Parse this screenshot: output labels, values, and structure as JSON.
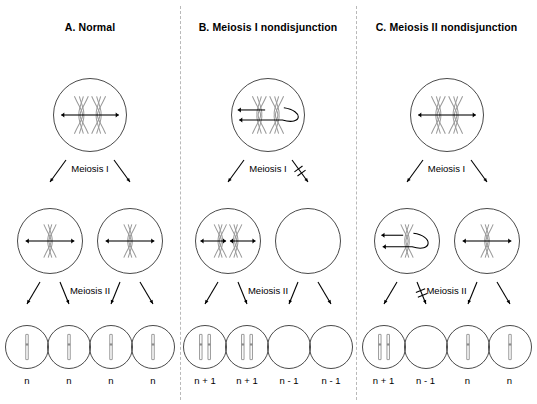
{
  "figure": {
    "background_color": "#ffffff",
    "divider_color": "#b9b9b9",
    "cell_outline_color": "#4a4a4a",
    "chromosome_color": "#9a9a9a",
    "arrow_color": "#000000"
  },
  "panels": [
    {
      "id": "A",
      "title": "A. Normal",
      "stage1_label": "Meiosis I",
      "stage2_label": "Meiosis II",
      "stage1_blocked": false,
      "stage2_blocked": false,
      "top_cell": {
        "chromosomes": 2,
        "arrows": "bidirectional",
        "nondisjunction": false
      },
      "middle_cells": [
        {
          "chromosomes": 1,
          "arrows": "bidirectional",
          "nondisjunction": false
        },
        {
          "chromosomes": 1,
          "arrows": "bidirectional",
          "nondisjunction": false
        }
      ],
      "gametes": [
        {
          "chromosomes": 1,
          "ploidy": "n"
        },
        {
          "chromosomes": 1,
          "ploidy": "n"
        },
        {
          "chromosomes": 1,
          "ploidy": "n"
        },
        {
          "chromosomes": 1,
          "ploidy": "n"
        }
      ]
    },
    {
      "id": "B",
      "title": "B. Meiosis I nondisjunction",
      "stage1_label": "Meiosis I",
      "stage2_label": "Meiosis II",
      "stage1_blocked": true,
      "stage2_blocked": false,
      "top_cell": {
        "chromosomes": 2,
        "arrows": "both-left-loop",
        "nondisjunction": true
      },
      "middle_cells": [
        {
          "chromosomes": 2,
          "arrows": "bidirectional-pair",
          "nondisjunction": false
        },
        {
          "chromosomes": 0,
          "arrows": "none",
          "nondisjunction": false
        }
      ],
      "gametes": [
        {
          "chromosomes": 2,
          "ploidy": "n + 1"
        },
        {
          "chromosomes": 2,
          "ploidy": "n + 1"
        },
        {
          "chromosomes": 0,
          "ploidy": "n - 1"
        },
        {
          "chromosomes": 0,
          "ploidy": "n - 1"
        }
      ]
    },
    {
      "id": "C",
      "title": "C. Meiosis II nondisjunction",
      "stage1_label": "Meiosis I",
      "stage2_label": "Meiosis II",
      "stage1_blocked": false,
      "stage2_blocked": true,
      "top_cell": {
        "chromosomes": 2,
        "arrows": "bidirectional",
        "nondisjunction": false
      },
      "middle_cells": [
        {
          "chromosomes": 1,
          "arrows": "both-left-loop",
          "nondisjunction": true
        },
        {
          "chromosomes": 1,
          "arrows": "bidirectional",
          "nondisjunction": false
        }
      ],
      "gametes": [
        {
          "chromosomes": 2,
          "ploidy": "n + 1"
        },
        {
          "chromosomes": 0,
          "ploidy": "n - 1"
        },
        {
          "chromosomes": 1,
          "ploidy": "n"
        },
        {
          "chromosomes": 1,
          "ploidy": "n"
        }
      ]
    }
  ]
}
